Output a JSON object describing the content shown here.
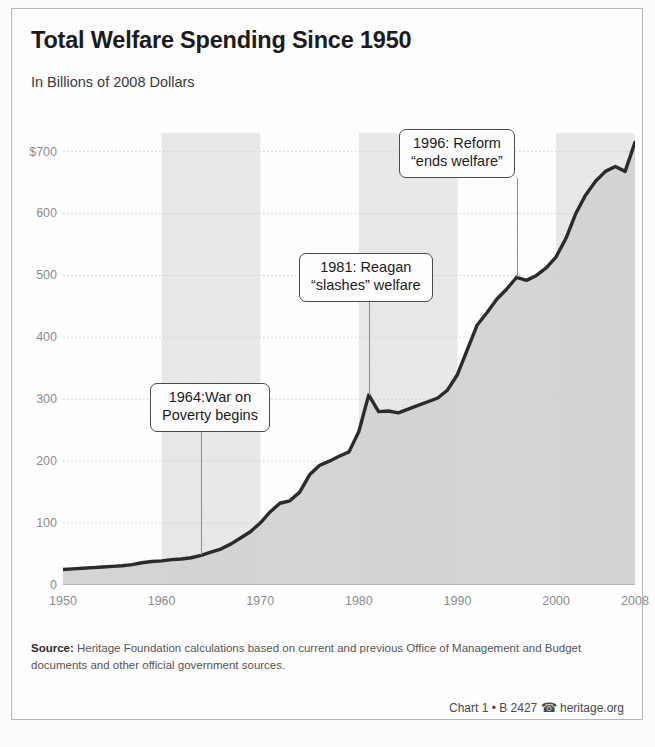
{
  "header": {
    "title": "Total Welfare Spending Since 1950",
    "subtitle": "In Billions of 2008 Dollars"
  },
  "footer": {
    "source_label": "Source:",
    "source_text": " Heritage Foundation calculations based on current and previous Office of Management and Budget documents and other official government sources.",
    "credit": "Chart 1 • B 2427",
    "phone_icon": "☎",
    "site": "heritage.org"
  },
  "chart_data": {
    "type": "area",
    "title": "Total Welfare Spending Since 1950",
    "subtitle": "In Billions of 2008 Dollars",
    "xlabel": "",
    "ylabel": "In Billions of 2008 Dollars",
    "xlim": [
      1950,
      2008
    ],
    "ylim": [
      0,
      730
    ],
    "grid": true,
    "legend": false,
    "y_ticks": [
      0,
      100,
      200,
      300,
      400,
      500,
      600,
      700
    ],
    "y_tick_labels": [
      "0",
      "100",
      "200",
      "300",
      "400",
      "500",
      "600",
      "700"
    ],
    "y_top_label": "$700",
    "x_ticks": [
      1950,
      1960,
      1970,
      1980,
      1990,
      2000,
      2008
    ],
    "x_tick_labels": [
      "1950",
      "1960",
      "1970",
      "1980",
      "1990",
      "2000",
      "2008"
    ],
    "x_minor_tick_step": 1,
    "colors": {
      "line": "#2b2b2b",
      "area": "#d2d2d2",
      "band": "#c4c4c4",
      "grid": "#c9c9c9",
      "axis_text": "#8d8d8d",
      "callout_border": "#4a4a4a"
    },
    "decade_bands": [
      [
        1960,
        1970
      ],
      [
        1980,
        1990
      ],
      [
        2000,
        2008
      ]
    ],
    "x": [
      1950,
      1951,
      1952,
      1953,
      1954,
      1955,
      1956,
      1957,
      1958,
      1959,
      1960,
      1961,
      1962,
      1963,
      1964,
      1965,
      1966,
      1967,
      1968,
      1969,
      1970,
      1971,
      1972,
      1973,
      1974,
      1975,
      1976,
      1977,
      1978,
      1979,
      1980,
      1981,
      1982,
      1983,
      1984,
      1985,
      1986,
      1987,
      1988,
      1989,
      1990,
      1991,
      1992,
      1993,
      1994,
      1995,
      1996,
      1997,
      1998,
      1999,
      2000,
      2001,
      2002,
      2003,
      2004,
      2005,
      2006,
      2007,
      2008
    ],
    "values": [
      25,
      26,
      27,
      28,
      29,
      30,
      31,
      33,
      36,
      38,
      39,
      41,
      42,
      44,
      48,
      53,
      58,
      66,
      76,
      86,
      100,
      118,
      132,
      136,
      150,
      178,
      193,
      200,
      208,
      215,
      248,
      307,
      280,
      281,
      278,
      284,
      290,
      296,
      302,
      315,
      340,
      380,
      420,
      440,
      462,
      478,
      497,
      492,
      500,
      512,
      530,
      560,
      600,
      630,
      652,
      668,
      676,
      668,
      715
    ],
    "annotations": [
      {
        "label": "1964: War on Poverty begins",
        "line1": "1964:War on",
        "line2": "Poverty begins",
        "x": 1964,
        "y": 48
      },
      {
        "label": "1981: Reagan \"slashes\" welfare",
        "line1": "1981: Reagan",
        "line2": "“slashes” welfare",
        "x": 1981,
        "y": 307
      },
      {
        "label": "1996: Reform \"ends welfare\"",
        "line1": "1996: Reform",
        "line2": "“ends welfare”",
        "x": 1996,
        "y": 497
      }
    ]
  }
}
